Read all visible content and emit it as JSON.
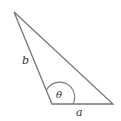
{
  "diagram": {
    "type": "triangle",
    "labels": {
      "side_left": "b",
      "side_bottom": "a",
      "angle": "θ"
    },
    "colors": {
      "stroke": "#777777",
      "text": "#333333",
      "background": "#ffffff"
    }
  }
}
